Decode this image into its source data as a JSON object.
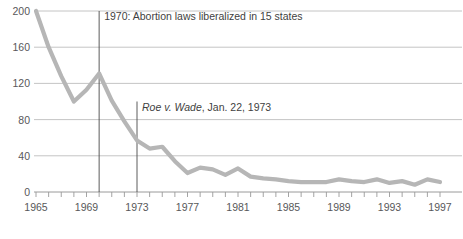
{
  "chart_data": {
    "type": "line",
    "title": "",
    "subtitle": "",
    "xlabel": "",
    "ylabel": "",
    "xlim": [
      1965,
      1997
    ],
    "ylim": [
      0,
      200
    ],
    "grid": true,
    "legend": "none",
    "series_color": "#b6b6b6",
    "x": [
      1965,
      1966,
      1967,
      1968,
      1969,
      1970,
      1971,
      1972,
      1973,
      1974,
      1975,
      1976,
      1977,
      1978,
      1979,
      1980,
      1981,
      1982,
      1983,
      1984,
      1985,
      1986,
      1987,
      1988,
      1989,
      1990,
      1991,
      1992,
      1993,
      1994,
      1995,
      1996,
      1997
    ],
    "values": [
      200,
      160,
      128,
      100,
      113,
      131,
      101,
      78,
      57,
      48,
      50,
      34,
      21,
      27,
      25,
      19,
      26,
      17,
      15,
      14,
      12,
      11,
      11,
      11,
      14,
      12,
      11,
      14,
      10,
      12,
      8,
      14,
      11
    ],
    "y_ticks": [
      0,
      40,
      80,
      120,
      160,
      200
    ],
    "y_tick_labels": [
      "0",
      "40",
      "80",
      "120",
      "160",
      "200"
    ],
    "x_ticks": [
      1965,
      1966,
      1967,
      1968,
      1969,
      1970,
      1971,
      1972,
      1973,
      1974,
      1975,
      1976,
      1977,
      1978,
      1979,
      1980,
      1981,
      1982,
      1983,
      1984,
      1985,
      1986,
      1987,
      1988,
      1989,
      1990,
      1991,
      1992,
      1993,
      1994,
      1995,
      1996,
      1997
    ],
    "x_tick_labels": [
      "1965",
      "",
      "",
      "",
      "1969",
      "",
      "",
      "",
      "1973",
      "",
      "",
      "",
      "1977",
      "",
      "",
      "",
      "1981",
      "",
      "",
      "",
      "1985",
      "",
      "",
      "",
      "1989",
      "",
      "",
      "",
      "1993",
      "",
      "",
      "",
      "1997"
    ],
    "annotations": [
      {
        "name": "annotation-1970",
        "year": 1970,
        "text": "1970: Abortion laws liberalized in 15 states",
        "italic_prefix": "",
        "rule_from": 200,
        "rule_to": 0
      },
      {
        "name": "annotation-roe-v-wade",
        "year": 1973,
        "text": ", Jan. 22, 1973",
        "italic_prefix": "Roe v. Wade",
        "rule_from": 100,
        "rule_to": 0
      }
    ]
  }
}
